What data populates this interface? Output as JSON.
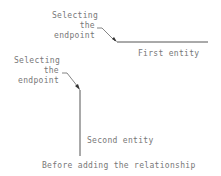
{
  "top_callout": {
    "lines": [
      "Selecting",
      "the",
      "endpoint"
    ]
  },
  "first_entity": {
    "label": "First entity"
  },
  "bottom_callout": {
    "lines": [
      "Selecting",
      "the",
      "endpoint"
    ]
  },
  "second_entity": {
    "label": "Second entity"
  },
  "caption": "Before adding the relationship",
  "colors": {
    "line": "#555555",
    "text": "#777777"
  }
}
